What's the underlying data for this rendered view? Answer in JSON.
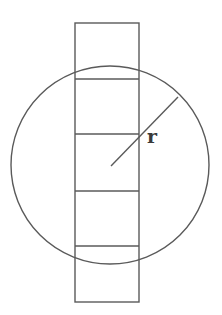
{
  "diagram": {
    "colors": {
      "stroke": "#5a5a5a",
      "label": "#3a3a3a",
      "background": "#ffffff"
    },
    "circle": {
      "cx": 110,
      "cy": 165,
      "r": 99
    },
    "rectangle": {
      "x": 75,
      "y": 23,
      "width": 64,
      "height": 279
    },
    "dividers_y": [
      79,
      134,
      191,
      246
    ],
    "radius_line": {
      "x1": 111,
      "y1": 166,
      "x2": 178,
      "y2": 97
    },
    "radius_label": {
      "text": "r",
      "x": 147,
      "y": 143
    }
  }
}
